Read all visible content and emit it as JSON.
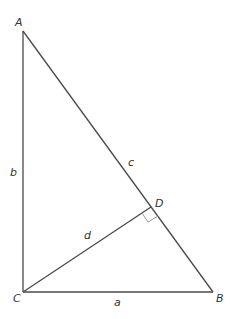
{
  "diagram": {
    "type": "right-triangle-with-altitude",
    "colors": {
      "line": "#4a4a4a",
      "right_angle_mark": "#9a9a9a",
      "text": "#333333"
    },
    "points": {
      "A": {
        "label": "A",
        "x": 23,
        "y": 31
      },
      "B": {
        "label": "B",
        "x": 213,
        "y": 292
      },
      "C": {
        "label": "C",
        "x": 23,
        "y": 292
      },
      "D": {
        "label": "D",
        "x": 151,
        "y": 207
      }
    },
    "sides": {
      "a": {
        "label": "a",
        "from": "C",
        "to": "B"
      },
      "b": {
        "label": "b",
        "from": "A",
        "to": "C"
      },
      "c": {
        "label": "c",
        "from": "A",
        "to": "B"
      },
      "d": {
        "label": "d",
        "from": "C",
        "to": "D"
      }
    },
    "right_angle_at": "D"
  }
}
